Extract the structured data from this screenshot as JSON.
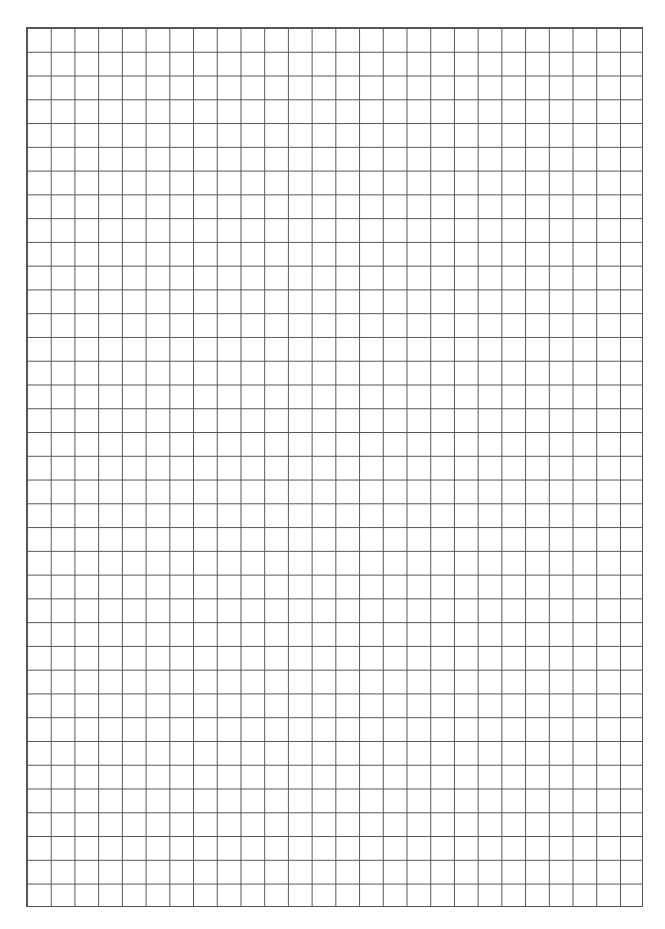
{
  "page": {
    "type": "grid-paper",
    "columns": 26,
    "rows": 37,
    "line_color": "#555555",
    "background": "#ffffff"
  }
}
